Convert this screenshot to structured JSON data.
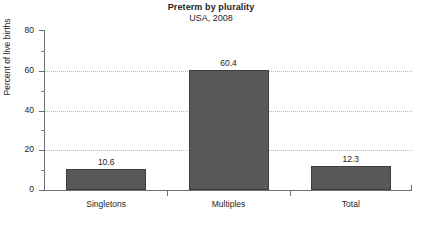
{
  "chart_data": {
    "type": "bar",
    "title": "Preterm by plurality",
    "subtitle": "USA, 2008",
    "xlabel": "",
    "ylabel": "Percent of live births",
    "categories": [
      "Singletons",
      "Multiples",
      "Total"
    ],
    "values": [
      10.6,
      60.4,
      12.3
    ],
    "value_labels": [
      "10.6",
      "60.4",
      "12.3"
    ],
    "ylim": [
      0,
      80
    ],
    "yticks": [
      0,
      20,
      40,
      60,
      80
    ],
    "ytick_labels": [
      "0",
      "20",
      "40",
      "60",
      "80"
    ],
    "yminor_ticks": [
      10,
      30,
      50,
      70
    ],
    "grid": "horizontal-dotted-at-major-ticks",
    "legend": "none",
    "bar_color": "#585858",
    "bar_edge_color": "#3e3e3e",
    "gridline_color": "#b9b9b9",
    "axis_color": "#6d6d6d",
    "background_color": "#ffffff"
  }
}
